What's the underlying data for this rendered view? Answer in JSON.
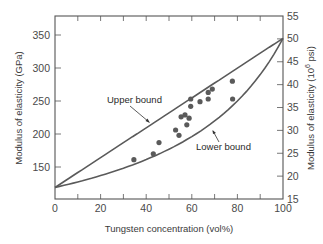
{
  "chart_data": {
    "type": "scatter",
    "title": "",
    "xlabel": "Tungsten concentration (vol%)",
    "ylabel": "Modulus of elasticity (GPa)",
    "ylabel_right": "Modulus of elasticity (10^6 psi)",
    "xlim": [
      0,
      100
    ],
    "ylim": [
      100,
      377
    ],
    "ylim_right": [
      15,
      55
    ],
    "x_ticks": [
      0,
      20,
      40,
      60,
      80,
      100
    ],
    "y_ticks": [
      150,
      200,
      250,
      300,
      350
    ],
    "y_ticks_right": [
      15,
      20,
      25,
      30,
      35,
      40,
      45,
      50,
      55
    ],
    "grid": false,
    "series": [
      {
        "name": "Experimental data",
        "kind": "scatter",
        "x": [
          34.6,
          43.1,
          45.6,
          52.9,
          54.4,
          55.3,
          57.0,
          57.8,
          58.8,
          59.5,
          59.5,
          63.6,
          67.2,
          67.2,
          69.0,
          77.8,
          77.9
        ],
        "y": [
          161,
          170,
          187,
          206,
          198,
          226,
          229,
          214,
          224,
          242,
          253,
          249,
          253,
          263,
          268,
          280,
          253
        ]
      },
      {
        "name": "Upper bound",
        "kind": "line",
        "model": "rule_of_mixtures_isostrain",
        "E_copper_GPa": 119,
        "E_tungsten_GPa": 345
      },
      {
        "name": "Lower bound",
        "kind": "line",
        "model": "inverse_rule_of_mixtures_isostress",
        "E_copper_GPa": 119,
        "E_tungsten_GPa": 345
      }
    ],
    "annotations": [
      {
        "text": "Upper bound",
        "points_to": "upper bound line"
      },
      {
        "text": "Lower bound",
        "points_to": "lower bound curve"
      }
    ],
    "legend": "none"
  },
  "labels": {
    "upper": "Upper bound",
    "lower": "Lower bound",
    "xlabel": "Tungsten concentration (vol%)",
    "ylabel_left": "Modulus of elasticity (GPa)",
    "ylabel_right_main": "Modulus of elasticity (10",
    "ylabel_right_sup": "6",
    "ylabel_right_tail": " psi)"
  }
}
